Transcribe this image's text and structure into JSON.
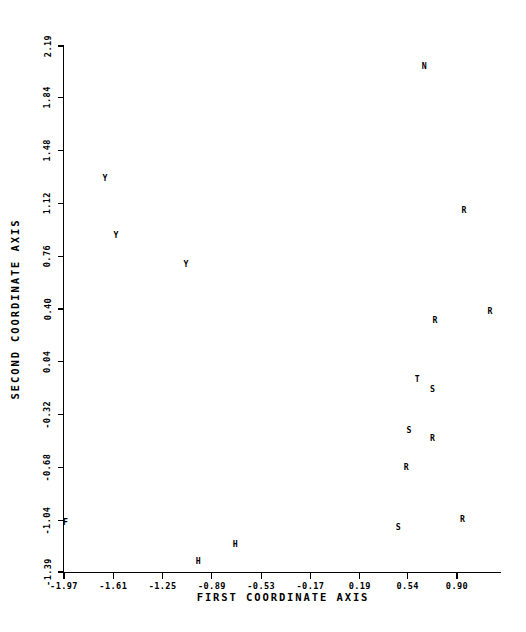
{
  "chart_data": {
    "type": "scatter",
    "title": "",
    "xlabel": "FIRST COORDINATE AXIS",
    "ylabel": "SECOND COORDINATE AXIS",
    "xlim": [
      -1.97,
      1.26
    ],
    "ylim": [
      -1.39,
      2.19
    ],
    "grid": false,
    "legend": null,
    "xticks": [
      "-1.97",
      "-1.61",
      "-1.25",
      "-0.89",
      "-0.53",
      "-0.17",
      "0.19",
      "0.54",
      "0.90"
    ],
    "xtick_values": [
      -1.97,
      -1.61,
      -1.25,
      -0.89,
      -0.53,
      -0.17,
      0.19,
      0.54,
      0.9
    ],
    "yticks": [
      "2.19",
      "1.84",
      "1.48",
      "1.12",
      "0.76",
      "0.40",
      "0.04",
      "-0.32",
      "-0.68",
      "-1.04",
      "-1.39"
    ],
    "ytick_values": [
      2.19,
      1.84,
      1.48,
      1.12,
      0.76,
      0.4,
      0.04,
      -0.32,
      -0.68,
      -1.04,
      -1.39
    ],
    "marker_style": "text-letter",
    "points": [
      {
        "label": "N",
        "x": 0.66,
        "y": 2.05
      },
      {
        "label": "Y",
        "x": -1.67,
        "y": 1.29
      },
      {
        "label": "R",
        "x": 0.95,
        "y": 1.07
      },
      {
        "label": "Y",
        "x": -1.59,
        "y": 0.9
      },
      {
        "label": "Y",
        "x": -1.08,
        "y": 0.7
      },
      {
        "label": "R",
        "x": 1.14,
        "y": 0.38
      },
      {
        "label": "R",
        "x": 0.74,
        "y": 0.32
      },
      {
        "label": "T",
        "x": 0.61,
        "y": -0.08
      },
      {
        "label": "S",
        "x": 0.72,
        "y": -0.15
      },
      {
        "label": "S",
        "x": 0.55,
        "y": -0.43
      },
      {
        "label": "R",
        "x": 0.72,
        "y": -0.48
      },
      {
        "label": "R",
        "x": 0.53,
        "y": -0.68
      },
      {
        "label": "F",
        "x": -1.96,
        "y": -1.05
      },
      {
        "label": "R",
        "x": 0.94,
        "y": -1.03
      },
      {
        "label": "S",
        "x": 0.47,
        "y": -1.09
      },
      {
        "label": "H",
        "x": -0.72,
        "y": -1.2
      },
      {
        "label": "H",
        "x": -0.99,
        "y": -1.32
      }
    ]
  }
}
